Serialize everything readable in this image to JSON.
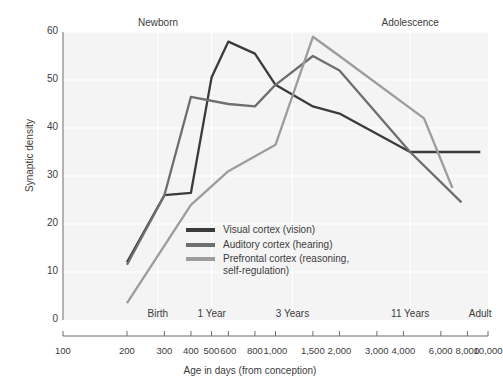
{
  "chart_data": {
    "type": "line",
    "title": "",
    "xlabel": "Age in days (from conception)",
    "ylabel": "Synaptic density",
    "xscale": "log",
    "xlim": [
      100,
      10000
    ],
    "ylim": [
      0,
      60
    ],
    "ytick_values": [
      0,
      10,
      20,
      30,
      40,
      50,
      60
    ],
    "ytick_labels": [
      "0",
      "10",
      "20",
      "30",
      "40",
      "50",
      "60"
    ],
    "xtick_values": [
      100,
      200,
      300,
      400,
      500,
      600,
      800,
      1000,
      1500,
      2000,
      3000,
      4000,
      6000,
      8000,
      10000
    ],
    "xtick_labels": [
      "100",
      "200",
      "300",
      "400",
      "500",
      "600",
      "800",
      "1,000",
      "1,500",
      "2,000",
      "3,000",
      "4,000",
      "6,000",
      "8,000",
      "10,000"
    ],
    "grid": true,
    "gridlines_x": [
      280,
      500,
      1200,
      4300
    ],
    "stage_labels_top": [
      {
        "text": "Newborn",
        "x": 280
      },
      {
        "text": "Adolescence",
        "x": 4300
      }
    ],
    "stage_labels_bottom": [
      {
        "text": "Birth",
        "x": 280
      },
      {
        "text": "1 Year",
        "x": 500
      },
      {
        "text": "3 Years",
        "x": 1200
      },
      {
        "text": "11 Years",
        "x": 4300
      },
      {
        "text": "Adult",
        "x": 9200
      }
    ],
    "legend_position": "inside-center",
    "series": [
      {
        "name": "Visual cortex (vision)",
        "color": "#3b3b3b",
        "points": [
          {
            "x": 200,
            "y": 12
          },
          {
            "x": 300,
            "y": 26
          },
          {
            "x": 400,
            "y": 26.5
          },
          {
            "x": 500,
            "y": 50.5
          },
          {
            "x": 600,
            "y": 58
          },
          {
            "x": 800,
            "y": 55.5
          },
          {
            "x": 1000,
            "y": 49
          },
          {
            "x": 1500,
            "y": 44.5
          },
          {
            "x": 2000,
            "y": 43
          },
          {
            "x": 4300,
            "y": 35
          },
          {
            "x": 9200,
            "y": 35
          }
        ]
      },
      {
        "name": "Auditory cortex (hearing)",
        "color": "#6e6e6e",
        "points": [
          {
            "x": 200,
            "y": 11.5
          },
          {
            "x": 300,
            "y": 26
          },
          {
            "x": 400,
            "y": 46.5
          },
          {
            "x": 600,
            "y": 45
          },
          {
            "x": 800,
            "y": 44.5
          },
          {
            "x": 1000,
            "y": 49
          },
          {
            "x": 1500,
            "y": 55
          },
          {
            "x": 2000,
            "y": 52
          },
          {
            "x": 4300,
            "y": 35
          },
          {
            "x": 7500,
            "y": 24.5
          }
        ]
      },
      {
        "name": "Prefrontal cortex (reasoning, self-regulation)",
        "color": "#9c9c9c",
        "points": [
          {
            "x": 200,
            "y": 3.5
          },
          {
            "x": 400,
            "y": 24
          },
          {
            "x": 600,
            "y": 31
          },
          {
            "x": 1000,
            "y": 36.5
          },
          {
            "x": 1500,
            "y": 59
          },
          {
            "x": 2000,
            "y": 55
          },
          {
            "x": 5000,
            "y": 42
          },
          {
            "x": 6800,
            "y": 27.5
          }
        ]
      }
    ]
  },
  "legend": {
    "items": [
      {
        "label": "Visual cortex (vision)",
        "color": "#3b3b3b"
      },
      {
        "label": "Auditory cortex (hearing)",
        "color": "#6e6e6e"
      },
      {
        "label": "Prefrontal cortex (reasoning,",
        "label2": "self-regulation)",
        "color": "#9c9c9c"
      }
    ]
  }
}
